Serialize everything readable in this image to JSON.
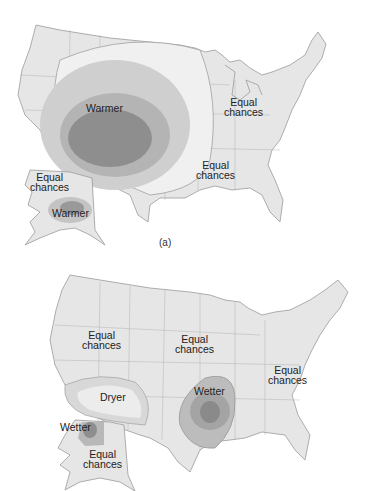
{
  "colors": {
    "land": "#e6e6e6",
    "border": "#9a9a9a",
    "tier1": "#cfcfcf",
    "tier2": "#b4b4b4",
    "tier3": "#8e8e8e",
    "dry1": "#d8d8d8",
    "dry2": "#ececec"
  },
  "panel_a": {
    "caption": "(a)",
    "labels": {
      "warmer_main": "Warmer",
      "equal_ne": "Equal\nchances",
      "equal_se": "Equal\nchances",
      "equal_ak": "Equal\nchances",
      "warmer_ak": "Warmer"
    }
  },
  "panel_b": {
    "labels": {
      "equal_nw": "Equal\nchances",
      "equal_central": "Equal\nchances",
      "equal_east": "Equal\nchances",
      "dryer": "Dryer",
      "wetter_south": "Wetter",
      "wetter_ak": "Wetter",
      "equal_ak": "Equal\nchances"
    }
  }
}
